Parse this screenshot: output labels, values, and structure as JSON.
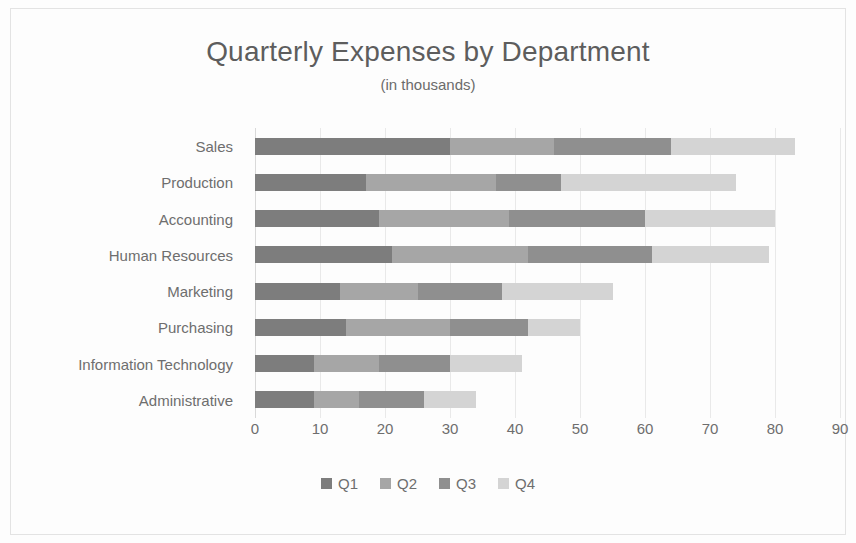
{
  "chart_data": {
    "type": "bar",
    "orientation": "horizontal",
    "stacked": true,
    "title": "Quarterly Expenses by Department",
    "subtitle": "(in thousands)",
    "xlabel": "",
    "ylabel": "",
    "xlim": [
      0,
      90
    ],
    "xticks": [
      0,
      10,
      20,
      30,
      40,
      50,
      60,
      70,
      80,
      90
    ],
    "grid": true,
    "grid_axis": "x",
    "legend_position": "bottom",
    "categories": [
      "Sales",
      "Production",
      "Accounting",
      "Human Resources",
      "Marketing",
      "Purchasing",
      "Information Technology",
      "Administrative"
    ],
    "series": [
      {
        "name": "Q1",
        "color": "#7d7d7d",
        "values": [
          30,
          17,
          19,
          21,
          13,
          14,
          9,
          9
        ]
      },
      {
        "name": "Q2",
        "color": "#a6a6a6",
        "values": [
          16,
          20,
          20,
          21,
          12,
          16,
          10,
          7
        ]
      },
      {
        "name": "Q3",
        "color": "#8f8f8f",
        "values": [
          18,
          10,
          21,
          19,
          13,
          12,
          11,
          10
        ]
      },
      {
        "name": "Q4",
        "color": "#d4d4d4",
        "values": [
          19,
          27,
          20,
          18,
          17,
          8,
          11,
          8
        ]
      }
    ],
    "totals": [
      83,
      74,
      80,
      79,
      55,
      50,
      41,
      34
    ]
  },
  "colors": {
    "background": "#fdfdfd",
    "border": "#e3e3e3",
    "title_text": "#5d5d5d",
    "label_text": "#6e6e6e",
    "gridline": "#e9e9e9"
  }
}
